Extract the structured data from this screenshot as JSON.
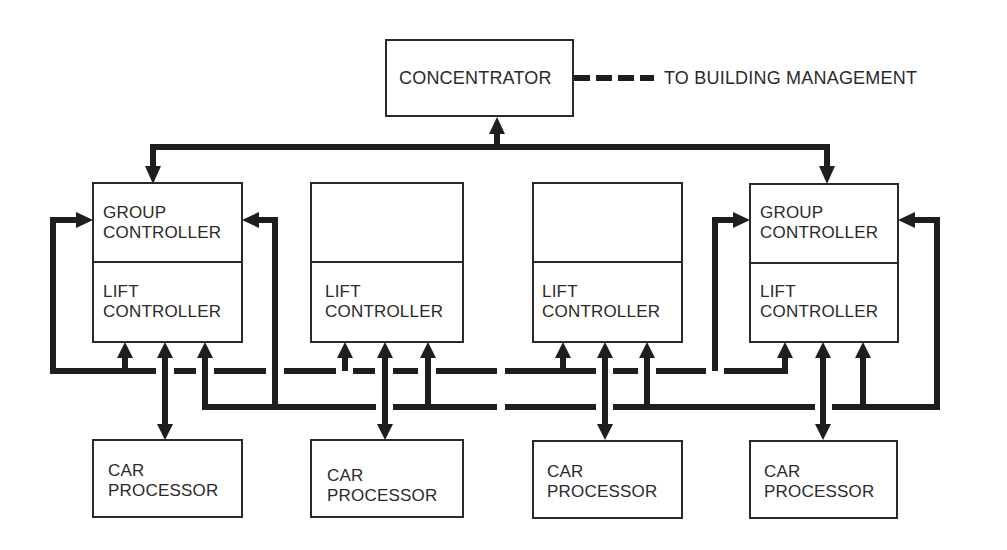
{
  "diagram": {
    "concentrator": {
      "label": "CONCENTRATOR"
    },
    "external_link": {
      "label": "TO BUILDING MANAGEMENT"
    },
    "controllers": [
      {
        "group_label_1": "GROUP",
        "group_label_2": "CONTROLLER",
        "lift_label_1": "LIFT",
        "lift_label_2": "CONTROLLER"
      },
      {
        "group_label_1": "",
        "group_label_2": "",
        "lift_label_1": "LIFT",
        "lift_label_2": "CONTROLLER"
      },
      {
        "group_label_1": "",
        "group_label_2": "",
        "lift_label_1": "LIFT",
        "lift_label_2": "CONTROLLER"
      },
      {
        "group_label_1": "GROUP",
        "group_label_2": "CONTROLLER",
        "lift_label_1": "LIFT",
        "lift_label_2": "CONTROLLER"
      }
    ],
    "car_processors": [
      {
        "label_1": "CAR",
        "label_2": "PROCESSOR"
      },
      {
        "label_1": "CAR",
        "label_2": "PROCESSOR"
      },
      {
        "label_1": "CAR",
        "label_2": "PROCESSOR"
      },
      {
        "label_1": "CAR",
        "label_2": "PROCESSOR"
      }
    ],
    "colors": {
      "line": "#1e1e1e",
      "box_stroke": "#2a2a2a",
      "background": "#ffffff"
    }
  }
}
